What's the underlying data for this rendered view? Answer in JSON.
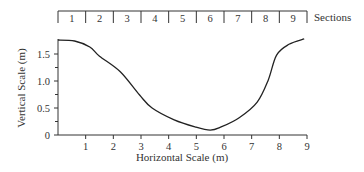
{
  "chart_data": {
    "type": "line",
    "title": "",
    "xlabel": "Horizontal Scale (m)",
    "ylabel": "Vertical Scale (m)",
    "xlim": [
      0,
      9
    ],
    "ylim": [
      0,
      1.76
    ],
    "x_ticks": [
      1,
      2,
      3,
      4,
      5,
      6,
      7,
      8,
      9
    ],
    "y_ticks": [
      0,
      0.5,
      1.0,
      1.5
    ],
    "y_tick_labels": [
      "0",
      "0.5",
      "1.0",
      "1.5"
    ],
    "y_minor_ticks": [
      0.25,
      0.75,
      1.25
    ],
    "grid": false,
    "legend": null,
    "series": [
      {
        "name": "Channel cross-section profile",
        "x": [
          0.0,
          0.6,
          1.15,
          1.5,
          2.25,
          2.95,
          3.4,
          4.2,
          4.95,
          5.5,
          5.9,
          6.55,
          7.2,
          7.6,
          7.9,
          8.35,
          8.9
        ],
        "y": [
          1.76,
          1.74,
          1.63,
          1.46,
          1.17,
          0.74,
          0.5,
          0.28,
          0.15,
          0.09,
          0.15,
          0.32,
          0.61,
          1.02,
          1.48,
          1.68,
          1.78
        ]
      }
    ],
    "sections_bar": {
      "label": "Sections",
      "sections": [
        "1",
        "2",
        "3",
        "4",
        "5",
        "6",
        "7",
        "8",
        "9"
      ]
    }
  }
}
